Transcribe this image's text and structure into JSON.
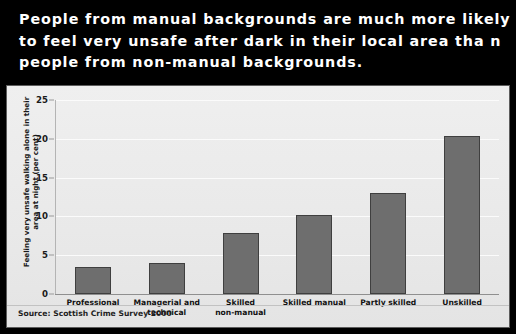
{
  "title": {
    "lines": [
      "People from manual backgrounds are much more likely",
      "to feel very unsafe after dark in their local area tha n",
      "people from non-manual backgrounds."
    ],
    "background_color": "#000000",
    "text_color": "#ffffff"
  },
  "source": {
    "label": "Source: Scottish Crime Survey 2000"
  },
  "colors": {
    "bar_fill": "#6e6e6e",
    "bar_border": "#3f3f3f",
    "plot_background": "#eaeaea",
    "gridline": "#fbfbfb",
    "card_border": "#5d5d5d"
  },
  "chart_data": {
    "type": "bar",
    "title": "People from manual backgrounds are much more likely to feel very unsafe after dark in their local area tha n people from non-manual backgrounds.",
    "xlabel": "",
    "ylabel": "Feeling very unsafe walking alone in their area at night (per cent)",
    "ylabel_lines": [
      "Feeling very unsafe walking alone in their",
      "area at night (per cent)"
    ],
    "categories": [
      "Professional",
      "Managerial and\ntechnical",
      "Skilled\nnon-manual",
      "Skilled manual",
      "Partly skilled",
      "Unskilled"
    ],
    "values": [
      3.5,
      4,
      7.8,
      10.2,
      13,
      20.3
    ],
    "ylim": [
      0,
      25
    ],
    "yticks": [
      0,
      5,
      10,
      15,
      20,
      25
    ],
    "ytick_labels": [
      "0",
      "5",
      "10",
      "15",
      "20",
      "25"
    ],
    "grid": true,
    "legend": false,
    "source": "Source: Scottish Crime Survey 2000"
  }
}
